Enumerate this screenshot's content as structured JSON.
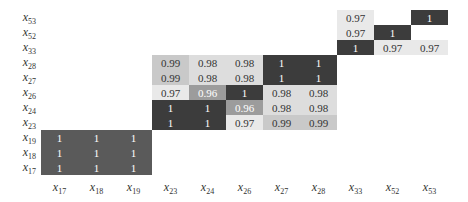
{
  "chart_data": {
    "type": "heatmap",
    "title": "",
    "xlabel": "",
    "ylabel": "",
    "x_categories": [
      "x17",
      "x18",
      "x19",
      "x23",
      "x24",
      "x26",
      "x27",
      "x28",
      "x33",
      "x52",
      "x53"
    ],
    "y_categories_top_to_bottom": [
      "x53",
      "x52",
      "x33",
      "x28",
      "x27",
      "x26",
      "x24",
      "x23",
      "x19",
      "x18",
      "x17"
    ],
    "colormap": "grayscale (1 = dark, 0.96 = mid-gray, 0.97-0.99 = light)",
    "blocks": [
      {
        "name": "block-1",
        "columns": [
          "x17",
          "x18",
          "x19"
        ],
        "rows": [
          "x19",
          "x18",
          "x17"
        ],
        "values": [
          [
            1,
            1,
            1
          ],
          [
            1,
            1,
            1
          ],
          [
            1,
            1,
            1
          ]
        ]
      },
      {
        "name": "block-2",
        "columns": [
          "x23",
          "x24",
          "x26",
          "x27",
          "x28"
        ],
        "rows": [
          "x28",
          "x27",
          "x26",
          "x24",
          "x23"
        ],
        "values": [
          [
            0.99,
            0.98,
            0.98,
            1,
            1
          ],
          [
            0.99,
            0.98,
            0.98,
            1,
            1
          ],
          [
            0.97,
            0.96,
            1,
            0.98,
            0.98
          ],
          [
            1,
            1,
            0.96,
            0.98,
            0.98
          ],
          [
            1,
            1,
            0.97,
            0.99,
            0.99
          ]
        ]
      },
      {
        "name": "block-3",
        "columns": [
          "x33",
          "x52",
          "x53"
        ],
        "rows": [
          "x53",
          "x52",
          "x33"
        ],
        "values": [
          [
            0.97,
            null,
            1
          ],
          [
            0.97,
            1,
            null
          ],
          [
            1,
            0.97,
            0.97
          ]
        ]
      }
    ],
    "grid": false,
    "legend": "none"
  },
  "colors": {
    "one_dark": "#3c3c3c",
    "one_block1": "#5a5a5a",
    "v099": "#c9c9c9",
    "v098": "#dddddd",
    "v097": "#e9e9e9",
    "v096": "#9c9c9c"
  }
}
